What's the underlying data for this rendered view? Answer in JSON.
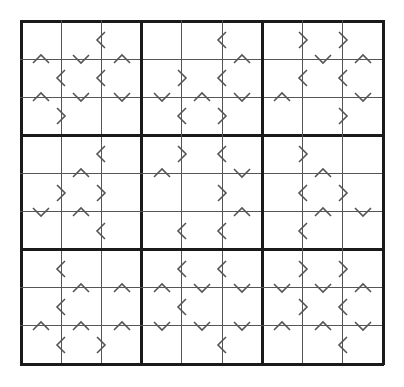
{
  "puzzle": {
    "type": "Greater-Than Sudoku",
    "size": 9,
    "box_size": 3,
    "colors": {
      "thin_line": "#555555",
      "thick_line": "#1a1a1a",
      "symbol": "#555555",
      "background": "#ffffff"
    },
    "givens": [],
    "horizontal_constraints_note": "h[r][c] is between cell (r,c) and (r,c+1): '<' left<right, '>' left>right, '' none",
    "h": [
      [
        "",
        "<",
        "",
        "",
        "<",
        "",
        ">",
        ">"
      ],
      [
        "<",
        "<",
        "",
        ">",
        "<",
        "",
        "<",
        "<"
      ],
      [
        ">",
        "",
        "",
        "<",
        ">",
        "",
        "",
        ">"
      ],
      [
        "",
        "<",
        "",
        ">",
        "<",
        "",
        ">",
        ""
      ],
      [
        ">",
        ">",
        "",
        "",
        ">",
        "",
        "<",
        ">"
      ],
      [
        "",
        "<",
        "",
        "<",
        "<",
        "",
        "<",
        ""
      ],
      [
        "<",
        "",
        "",
        "<",
        "<",
        "",
        ">",
        ">"
      ],
      [
        "<",
        "",
        "",
        "<",
        "",
        "",
        ">",
        "<"
      ],
      [
        "<",
        ">",
        "",
        "",
        "<",
        "",
        "",
        "<"
      ]
    ],
    "vertical_constraints_note": "v[r][c] is between cell (r,c) and (r+1,c): '^' top<bottom, 'v' top>bottom, '' none",
    "v": [
      [
        "^",
        "v",
        "^",
        "",
        "",
        "^",
        "",
        "v",
        "^"
      ],
      [
        "^",
        "v",
        "v",
        "v",
        "^",
        "v",
        "^",
        "",
        "v"
      ],
      [
        "",
        "",
        "",
        "",
        "",
        "",
        "",
        "",
        ""
      ],
      [
        "",
        "^",
        "",
        "^",
        "",
        "v",
        "",
        "^",
        ""
      ],
      [
        "v",
        "^",
        "",
        "",
        "",
        "^",
        "",
        "^",
        "v"
      ],
      [
        "",
        "",
        "",
        "",
        "",
        "",
        "",
        "",
        ""
      ],
      [
        "",
        "^",
        "^",
        "^",
        "v",
        "v",
        "v",
        "v",
        "^"
      ],
      [
        "^",
        "^",
        "^",
        "v",
        "v",
        "v",
        "^",
        "^",
        "v"
      ]
    ]
  }
}
